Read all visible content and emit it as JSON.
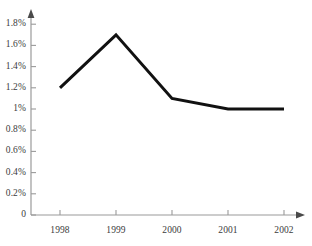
{
  "chart_data": {
    "type": "line",
    "title": "",
    "subtitle": "",
    "xlabel": "",
    "ylabel": "",
    "categories": [
      "1998",
      "1999",
      "2000",
      "2001",
      "2002"
    ],
    "x": [
      "1998",
      "1999",
      "2000",
      "2001",
      "2002"
    ],
    "values": [
      1.2,
      1.7,
      1.1,
      1.0,
      1.0
    ],
    "value_labels": [
      "1.2%",
      "1.7%",
      "1.1%",
      "1%",
      "1%"
    ],
    "series": [
      {
        "name": "",
        "values": [
          1.2,
          1.7,
          1.1,
          1.0,
          1.0
        ],
        "color": "#111111",
        "line_width": 3,
        "markers": false
      }
    ],
    "ylim": [
      0,
      1.8
    ],
    "ytick_values": [
      0,
      0.2,
      0.4,
      0.6,
      0.8,
      1.0,
      1.2,
      1.4,
      1.6,
      1.8
    ],
    "ytick_labels": [
      "0",
      "0.2%",
      "0.4%",
      "0.6%",
      "0.8%",
      "1%",
      "1.2%",
      "1.4%",
      "1.6%",
      "1.8%"
    ],
    "xtick_labels": [
      "1998",
      "1999",
      "2000",
      "2001",
      "2002"
    ],
    "grid": false,
    "legend": false,
    "legend_position": "none",
    "axis_arrows": true,
    "axis_color": "#9a9a9a",
    "tick_color": "#9a9a9a",
    "text_color": "#3b3b3b",
    "background": "#ffffff",
    "annotations": []
  }
}
